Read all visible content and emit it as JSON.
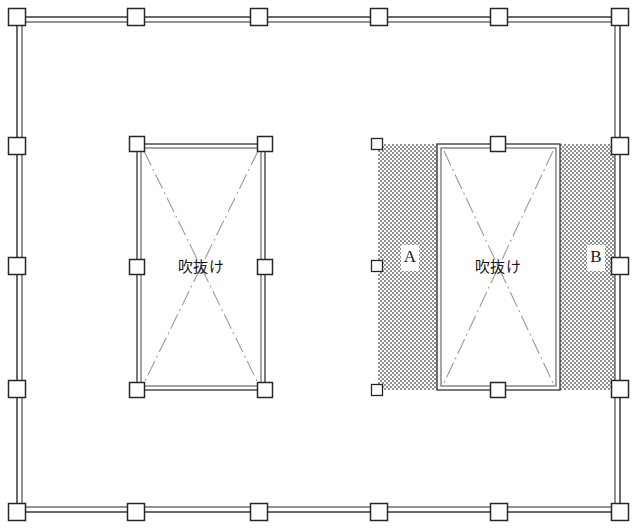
{
  "drawing": {
    "title": "構造伏図",
    "width": 637,
    "height": 532,
    "background_color": "#ffffff"
  },
  "colors": {
    "wall_stroke": "#2b2b2b",
    "column_fill": "#ffffff",
    "column_stroke": "#262626",
    "diagonal_line": "#9a9a9a",
    "hatch_gray": "#8f8f8f",
    "text": "#141414"
  },
  "outer_wall": {
    "name": "building-perimeter",
    "x1": 17,
    "y1": 17,
    "x2": 620,
    "y2": 512,
    "wall_gap": 5
  },
  "perimeter_columns": {
    "top_y": 17,
    "bottom_y": 512,
    "left_x": 17,
    "right_x": 620,
    "top_x": [
      17,
      136,
      259,
      379,
      499,
      620
    ],
    "bottom_x": [
      17,
      136,
      259,
      379,
      499,
      620
    ],
    "left_y": [
      17,
      146,
      266,
      389,
      512
    ],
    "right_y": [
      17,
      146,
      266,
      389,
      512
    ],
    "size": 17
  },
  "voids": [
    {
      "id": "void-left",
      "label": "吹抜け",
      "x1": 137,
      "y1": 144,
      "x2": 265,
      "y2": 390,
      "wall_gap": 4,
      "label_x": 201,
      "label_y": 267,
      "columns": [
        {
          "x": 137,
          "y": 144
        },
        {
          "x": 265,
          "y": 144
        },
        {
          "x": 137,
          "y": 267
        },
        {
          "x": 265,
          "y": 267
        },
        {
          "x": 137,
          "y": 390
        },
        {
          "x": 265,
          "y": 390
        }
      ],
      "column_size": 15,
      "diagonals": true
    },
    {
      "id": "void-right",
      "label": "吹抜け",
      "x1": 437,
      "y1": 144,
      "x2": 560,
      "y2": 390,
      "wall_gap": 4,
      "label_x": 498,
      "label_y": 267,
      "columns": [
        {
          "x": 498,
          "y": 144
        },
        {
          "x": 498,
          "y": 390
        }
      ],
      "column_size": 15,
      "diagonals": true
    }
  ],
  "hatched_zones": [
    {
      "id": "zone-a",
      "label": "A",
      "x": 378,
      "y": 144,
      "width": 59,
      "height": 246,
      "label_x": 410,
      "label_y": 258,
      "patch_width": 18,
      "patch_height": 26
    },
    {
      "id": "zone-b",
      "label": "B",
      "x": 560,
      "y": 144,
      "width": 55,
      "height": 246,
      "label_x": 596,
      "label_y": 258,
      "patch_width": 18,
      "patch_height": 26
    }
  ],
  "edge_markers": {
    "name": "zone-a-edge-columns",
    "x": 377,
    "ys": [
      144,
      266,
      390
    ],
    "size": 11
  }
}
